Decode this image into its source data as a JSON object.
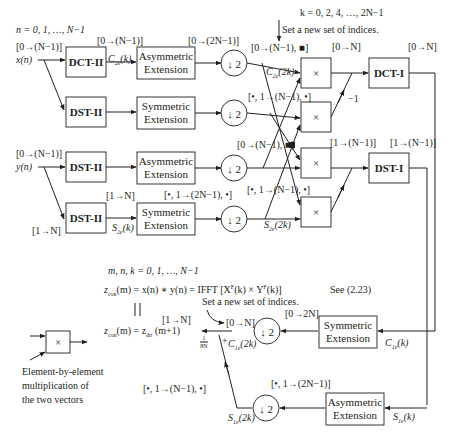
{
  "diagram": {
    "index_range_n": "n = 0, 1, …, N−1",
    "index_range_k": "k = 0, 2, 4, …, 2N−1",
    "set_new_indices_top": "Set a new set of indices.",
    "set_new_indices_bottom": "Set a new set of indices.",
    "index_range_mnk": "m, n, k = 0, 1, …, N−1",
    "inputs": {
      "x_label": "x(n)",
      "x_range": "[0→(N−1)]",
      "y_label": "y(n)",
      "y_range": "[0→(N−1)]",
      "y_dst_range_in": "[1→N]"
    },
    "blocks": {
      "dct2_x": "DCT-II",
      "dst2_x": "DST-II",
      "dst2_y1": "DST-II",
      "dst2_y2": "DST-II",
      "asym_x_line1": "Asymmetric",
      "asym_x_line2": "Extension",
      "sym_x_line1": "Symmetric",
      "sym_x_line2": "Extension",
      "asym_y_line1": "Asymmetric",
      "asym_y_line2": "Extension",
      "sym_y_line1": "Symmetric",
      "sym_y_line2": "Extension",
      "dct1": "DCT-I",
      "dst1": "DST-I",
      "sym_out_line1": "Symmetric",
      "sym_out_line2": "Extension",
      "asym_out_line1": "Asymmetric",
      "asym_out_line2": "Extension",
      "downsample": "↓ 2",
      "multiply": "×"
    },
    "signals": {
      "c2e_k": "C",
      "c2e_sub": "2e",
      "c2e_arg": "(k)",
      "s2e_k": "S",
      "s2e_sub": "2e",
      "s2e_arg": "(k)",
      "c2e_2k": "C",
      "c2e_2k_arg": "(2k)",
      "s2e_2k": "S",
      "s2e_2k_arg": "(2k)",
      "c1e_k": "C",
      "c1e_sub": "1e",
      "c1e_arg": "(k)",
      "s1e_k": "S",
      "s1e_sub": "1e",
      "s1e_arg": "(k)",
      "c1e_2k_arg": "(2k)",
      "s1e_2k_arg": "(2k)"
    },
    "ranges": {
      "dct2_out": "[0→(N−1)]",
      "asym_x_out": "[0→(2N−1)]",
      "ds_c2e_out": "[0→(N−1), ■]",
      "ds_sym_x_out": "[•, 1→(N−1), •]",
      "mult_dct1_in": "[0→N]",
      "dct1_out": "[0→N]",
      "minus_one": "−1",
      "ds_asym_y_out": "[0→(N−1), ■]",
      "sym_y_in": "[1→N]",
      "sym_y_out": "[•, 1→(2N−1), •]",
      "ds_s2e_out": "[•, 1→(N−1), •]",
      "mult_dst1_in": "[1→(N−1)]",
      "dst1_out": "[1→(N−1)]",
      "sym_out_in": "[0→2N]",
      "ds_c1e_out": "[0→N]",
      "result_range": "[1→N]",
      "asym_out_out": "[•, 1→(2N−1)]",
      "ds_s1e_out": "[•, 1→(N−1), •]",
      "plus_sign": "+",
      "scale_num": "1",
      "scale_den": "8N"
    },
    "equations": {
      "zcon_eq_lhs": "z",
      "zcon_sub": "con",
      "zcon_eq_rest": "(m) = x(n) ∗ y(n) = IFFT [X",
      "zcon_eq_ifft_rest": "(k) × Y",
      "zcon_eq_end": "(k)]",
      "fsup": "F",
      "see_ref": "See (2.23)",
      "equiv": "||",
      "zcon2_rest": "(m) = z",
      "zdtt_sub": "dtt",
      "zdtt_arg": " (m+1)"
    },
    "legend": {
      "symbol": "×",
      "line1": "Element-by-element",
      "line2": "multiplication of",
      "line3": "the two vectors"
    }
  }
}
